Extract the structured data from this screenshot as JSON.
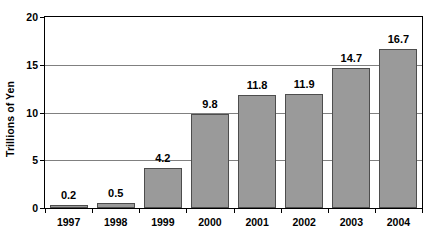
{
  "chart_data": {
    "type": "bar",
    "title": "",
    "subtitle": "",
    "xlabel": "",
    "ylabel": "Trillions of Yen",
    "categories": [
      "1997",
      "1998",
      "1999",
      "2000",
      "2001",
      "2002",
      "2003",
      "2004"
    ],
    "values": [
      0.2,
      0.5,
      4.2,
      9.8,
      11.8,
      11.9,
      14.7,
      16.7
    ],
    "value_labels": [
      "0.2",
      "0.5",
      "4.2",
      "9.8",
      "11.8",
      "11.9",
      "14.7",
      "16.7"
    ],
    "ylim": [
      0,
      20
    ],
    "ytick_values": [
      0,
      5,
      10,
      15,
      20
    ],
    "ytick_labels": [
      "0",
      "5",
      "10",
      "15",
      "20"
    ],
    "grid": true,
    "grid_axis": "y",
    "legend": false,
    "legend_position": "none",
    "bar_fill_color": "#9a9a9a",
    "bar_border_color": "#4d4d4d",
    "gridline_color": "#808080",
    "axis_color": "#000000",
    "text_color": "#000000",
    "background_color": "#ffffff",
    "data_labels_shown": true
  }
}
